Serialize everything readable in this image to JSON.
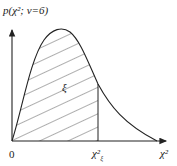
{
  "diagram": {
    "y_axis_label": "p(χ²; ν=6)",
    "x_axis_label": "χ²",
    "origin_label": "0",
    "area_label": "ξ",
    "quantile_label": "χ²",
    "quantile_subscript": "ξ",
    "quantile_superscript": "",
    "degrees_of_freedom": 6,
    "colors": {
      "line": "#222222",
      "hatch": "#333333",
      "background": "#ffffff"
    }
  }
}
